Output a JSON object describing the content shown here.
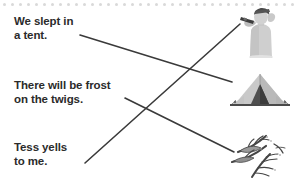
{
  "worksheet": {
    "type": "matching-exercise",
    "perforation": {
      "dot_count": 37,
      "dot_spacing": 8,
      "dot_color": "#d9d9d9"
    },
    "line_color": "#3a3a3a",
    "text_color": "#2b2b2b",
    "prompts": [
      {
        "id": "prompt-0",
        "text": "We slept in\na tent."
      },
      {
        "id": "prompt-1",
        "text": "There will be frost\non the twigs."
      },
      {
        "id": "prompt-2",
        "text": "Tess yells\nto me."
      }
    ],
    "pictures": [
      {
        "id": "pic-shouting",
        "icon": "person-shouting-icon",
        "label": "person shouting with hands cupped"
      },
      {
        "id": "pic-tent",
        "icon": "tent-icon",
        "label": "camping tent"
      },
      {
        "id": "pic-twigs",
        "icon": "frosted-twigs-icon",
        "label": "frosted twigs and branches"
      }
    ],
    "connections": [
      {
        "id": "line-tent",
        "from": "prompt-0",
        "to": "pic-tent",
        "x1": 80,
        "y1": 35,
        "x2": 232,
        "y2": 82
      },
      {
        "id": "line-twigs",
        "from": "prompt-1",
        "to": "pic-twigs",
        "x1": 125,
        "y1": 98,
        "x2": 234,
        "y2": 152
      },
      {
        "id": "line-shouting",
        "from": "prompt-2",
        "to": "pic-shouting",
        "x1": 85,
        "y1": 163,
        "x2": 240,
        "y2": 24
      }
    ]
  }
}
